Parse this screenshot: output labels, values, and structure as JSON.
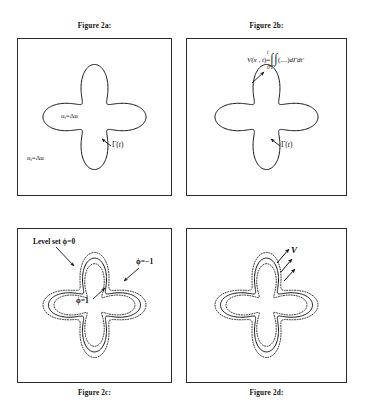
{
  "document": {
    "kind": "figure-plate",
    "background": "#ffffff",
    "ink": "#111111"
  },
  "panels": [
    {
      "id": "2a",
      "caption": "Figure 2a:",
      "caption_position": "top",
      "labels": {
        "interior_pde": "u",
        "interior_pde_sub": "t",
        "interior_pde_rest": "=Δu",
        "exterior_pde": "u",
        "exterior_pde_sub": "t",
        "exterior_pde_rest": "=Δu",
        "interface": "Γ(",
        "interface_var": "t",
        "interface_close": ")"
      }
    },
    {
      "id": "2b",
      "caption": "Figure 2b:",
      "caption_position": "top",
      "labels": {
        "potential_lhs": "V(",
        "potential_x": "x",
        "potential_comma": " , ",
        "potential_t": "t",
        "potential_eq": ")=",
        "integral_upper": "t",
        "integral_lower": "0",
        "integral_contour": "Γ",
        "integrand": "(....)",
        "measure": "dΓdt′",
        "interface": "Γ(",
        "interface_var": "t",
        "interface_close": ")"
      }
    },
    {
      "id": "2c",
      "caption": "Figure 2c:",
      "caption_position": "bottom",
      "labels": {
        "level_set": "Level set ϕ=0",
        "phi_negative": "ϕ=−1",
        "phi_positive": "ϕ=1"
      }
    },
    {
      "id": "2d",
      "caption": "Figure 2d:",
      "caption_position": "bottom",
      "labels": {
        "velocity": "V"
      }
    }
  ],
  "chart_data": {
    "type": "line",
    "curve": {
      "name": "four-lobed star interface Γ(t)",
      "polar_form": "r(θ) = r0 + a*cos(4θ)",
      "r0": 0.62,
      "amplitude": 0.3,
      "lobes": 4,
      "samples": 360
    },
    "offsets": {
      "inner_dotted": -0.11,
      "outer_dotted": 0.11,
      "inner_label": "ϕ=1",
      "outer_label": "ϕ=−1",
      "solid_label": "ϕ=0"
    },
    "annotations": [
      {
        "panel": "2a",
        "text": "u_t=Δu",
        "role": "interior-equation"
      },
      {
        "panel": "2a",
        "text": "u_t=Δu",
        "role": "exterior-equation"
      },
      {
        "panel": "2a",
        "text": "Γ(t)",
        "role": "interface-pointer",
        "arrow": true
      },
      {
        "panel": "2b",
        "text": "V(x,t)=∫₀ᵗ∫Γ(....)dΓdt′",
        "role": "boundary-integral",
        "arrow": true
      },
      {
        "panel": "2b",
        "text": "Γ(t)",
        "role": "interface-pointer",
        "arrow": true
      },
      {
        "panel": "2c",
        "text": "Level set ϕ=0",
        "role": "zero-level-set-pointer",
        "arrow": true
      },
      {
        "panel": "2c",
        "text": "ϕ=−1",
        "role": "outer-contour-pointer",
        "arrow": true
      },
      {
        "panel": "2c",
        "text": "ϕ=1",
        "role": "inner-contour-pointer",
        "arrow": true
      },
      {
        "panel": "2d",
        "text": "V",
        "role": "normal-velocity-vectors",
        "arrow": true
      }
    ],
    "legend": "none",
    "grid": false,
    "axes": "none"
  }
}
